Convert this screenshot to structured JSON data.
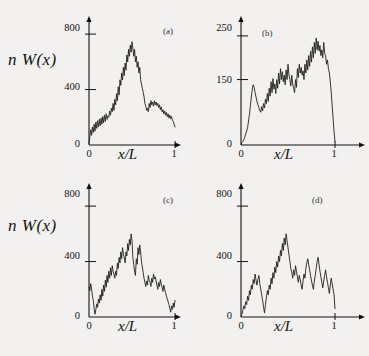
{
  "figure": {
    "background": "#f2f1ef",
    "ink": "#111111",
    "curve_color": "#1f1f1f"
  },
  "chart_data": [
    {
      "type": "line",
      "title": "",
      "panel_label": "(a)",
      "xlabel": "x/L",
      "ylabel": "n W(x)",
      "xlim": [
        0,
        1.05
      ],
      "ylim": [
        0,
        880
      ],
      "xticks": [
        0,
        1
      ],
      "xtick_labels": [
        "0",
        "1"
      ],
      "yticks": [
        0,
        400,
        800
      ],
      "ytick_labels": [
        "0",
        "400",
        "800"
      ],
      "grid": false,
      "legend": "none",
      "x": [
        0.0,
        0.01,
        0.02,
        0.03,
        0.04,
        0.05,
        0.06,
        0.07,
        0.08,
        0.09,
        0.1,
        0.11,
        0.12,
        0.13,
        0.14,
        0.15,
        0.16,
        0.17,
        0.18,
        0.19,
        0.2,
        0.21,
        0.22,
        0.23,
        0.24,
        0.25,
        0.26,
        0.27,
        0.28,
        0.29,
        0.3,
        0.31,
        0.32,
        0.33,
        0.34,
        0.35,
        0.36,
        0.37,
        0.38,
        0.39,
        0.4,
        0.41,
        0.42,
        0.43,
        0.44,
        0.45,
        0.46,
        0.47,
        0.48,
        0.49,
        0.5,
        0.51,
        0.52,
        0.53,
        0.54,
        0.55,
        0.56,
        0.57,
        0.58,
        0.59,
        0.6,
        0.61,
        0.62,
        0.63,
        0.64,
        0.65,
        0.66,
        0.67,
        0.68,
        0.69,
        0.7,
        0.71,
        0.72,
        0.73,
        0.74,
        0.75,
        0.76,
        0.77,
        0.78,
        0.79,
        0.8,
        0.81,
        0.82,
        0.83,
        0.84,
        0.85,
        0.86,
        0.87,
        0.88,
        0.89,
        0.9,
        0.91,
        0.92,
        0.93,
        0.94,
        0.95,
        0.96,
        0.97,
        0.98,
        0.99,
        1.0
      ],
      "values": [
        10,
        60,
        110,
        70,
        130,
        90,
        150,
        100,
        165,
        120,
        175,
        130,
        185,
        140,
        195,
        150,
        205,
        160,
        215,
        170,
        225,
        185,
        210,
        200,
        245,
        215,
        265,
        240,
        300,
        250,
        330,
        290,
        370,
        320,
        420,
        360,
        470,
        430,
        520,
        470,
        560,
        500,
        590,
        540,
        650,
        600,
        690,
        640,
        720,
        670,
        745,
        700,
        640,
        690,
        600,
        640,
        560,
        600,
        520,
        560,
        470,
        440,
        410,
        380,
        350,
        300,
        280,
        250,
        265,
        240,
        300,
        270,
        320,
        290,
        310,
        280,
        320,
        290,
        310,
        285,
        300,
        270,
        290,
        255,
        275,
        240,
        255,
        225,
        245,
        215,
        235,
        205,
        225,
        195,
        215,
        190,
        205,
        180,
        170,
        150,
        130
      ]
    },
    {
      "type": "line",
      "title": "",
      "panel_label": "(b)",
      "xlabel": "x/L",
      "ylabel": "",
      "xlim": [
        0,
        1.05
      ],
      "ylim": [
        0,
        275
      ],
      "xticks": [
        0,
        1
      ],
      "xtick_labels": [
        "0",
        "1"
      ],
      "yticks": [
        0,
        150,
        250
      ],
      "ytick_labels": [
        "0",
        "150",
        "250"
      ],
      "grid": false,
      "legend": "none",
      "x": [
        0.0,
        0.01,
        0.02,
        0.03,
        0.04,
        0.05,
        0.06,
        0.07,
        0.08,
        0.09,
        0.1,
        0.11,
        0.12,
        0.13,
        0.14,
        0.15,
        0.16,
        0.17,
        0.18,
        0.19,
        0.2,
        0.21,
        0.22,
        0.23,
        0.24,
        0.25,
        0.26,
        0.27,
        0.28,
        0.29,
        0.3,
        0.31,
        0.32,
        0.33,
        0.34,
        0.35,
        0.36,
        0.37,
        0.38,
        0.39,
        0.4,
        0.41,
        0.42,
        0.43,
        0.44,
        0.45,
        0.46,
        0.47,
        0.48,
        0.49,
        0.5,
        0.51,
        0.52,
        0.53,
        0.54,
        0.55,
        0.56,
        0.57,
        0.58,
        0.59,
        0.6,
        0.61,
        0.62,
        0.63,
        0.64,
        0.65,
        0.66,
        0.67,
        0.68,
        0.69,
        0.7,
        0.71,
        0.72,
        0.73,
        0.74,
        0.75,
        0.76,
        0.77,
        0.78,
        0.79,
        0.8,
        0.81,
        0.82,
        0.83,
        0.84,
        0.85,
        0.86,
        0.87,
        0.88,
        0.89,
        0.9,
        0.91,
        0.92,
        0.93,
        0.94,
        0.95,
        0.96,
        0.97,
        0.98,
        0.99,
        1.0
      ],
      "values": [
        2,
        5,
        8,
        12,
        18,
        25,
        32,
        40,
        55,
        70,
        90,
        110,
        128,
        138,
        132,
        120,
        110,
        100,
        92,
        86,
        80,
        75,
        88,
        78,
        95,
        85,
        105,
        95,
        118,
        100,
        130,
        112,
        145,
        120,
        152,
        128,
        140,
        118,
        150,
        130,
        165,
        140,
        175,
        150,
        168,
        145,
        160,
        138,
        172,
        150,
        185,
        160,
        150,
        135,
        160,
        140,
        130,
        120,
        150,
        132,
        175,
        155,
        185,
        165,
        178,
        160,
        170,
        150,
        185,
        165,
        195,
        172,
        205,
        180,
        215,
        190,
        225,
        200,
        235,
        210,
        245,
        218,
        238,
        215,
        228,
        205,
        218,
        200,
        235,
        210,
        205,
        185,
        195,
        175,
        165,
        145,
        120,
        90,
        60,
        30,
        8
      ]
    },
    {
      "type": "line",
      "title": "",
      "panel_label": "(c)",
      "xlabel": "x/L",
      "ylabel": "n W(x)",
      "xlim": [
        0,
        1.05
      ],
      "ylim": [
        0,
        880
      ],
      "xticks": [
        0,
        1
      ],
      "xtick_labels": [
        "0",
        "1"
      ],
      "yticks": [
        0,
        400,
        800
      ],
      "ytick_labels": [
        "0",
        "400",
        "800"
      ],
      "grid": false,
      "legend": "none",
      "x": [
        0.0,
        0.01,
        0.02,
        0.03,
        0.04,
        0.05,
        0.06,
        0.07,
        0.08,
        0.09,
        0.1,
        0.11,
        0.12,
        0.13,
        0.14,
        0.15,
        0.16,
        0.17,
        0.18,
        0.19,
        0.2,
        0.21,
        0.22,
        0.23,
        0.24,
        0.25,
        0.26,
        0.27,
        0.28,
        0.29,
        0.3,
        0.31,
        0.32,
        0.33,
        0.34,
        0.35,
        0.36,
        0.37,
        0.38,
        0.39,
        0.4,
        0.41,
        0.42,
        0.43,
        0.44,
        0.45,
        0.46,
        0.47,
        0.48,
        0.49,
        0.5,
        0.51,
        0.52,
        0.53,
        0.54,
        0.55,
        0.56,
        0.57,
        0.58,
        0.59,
        0.6,
        0.61,
        0.62,
        0.63,
        0.64,
        0.65,
        0.66,
        0.67,
        0.68,
        0.69,
        0.7,
        0.71,
        0.72,
        0.73,
        0.74,
        0.75,
        0.76,
        0.77,
        0.78,
        0.79,
        0.8,
        0.81,
        0.82,
        0.83,
        0.84,
        0.85,
        0.86,
        0.87,
        0.88,
        0.89,
        0.9,
        0.91,
        0.92,
        0.93,
        0.94,
        0.95,
        0.96,
        0.97,
        0.98,
        0.99,
        1.0
      ],
      "values": [
        215,
        190,
        240,
        200,
        150,
        120,
        60,
        20,
        55,
        95,
        70,
        130,
        100,
        160,
        120,
        200,
        150,
        230,
        185,
        265,
        215,
        300,
        250,
        330,
        280,
        355,
        300,
        370,
        330,
        310,
        280,
        330,
        300,
        390,
        350,
        430,
        390,
        470,
        420,
        500,
        455,
        430,
        390,
        470,
        440,
        530,
        480,
        560,
        520,
        600,
        550,
        430,
        380,
        330,
        300,
        420,
        380,
        500,
        450,
        520,
        470,
        400,
        360,
        320,
        280,
        250,
        220,
        260,
        230,
        300,
        265,
        250,
        220,
        280,
        250,
        310,
        275,
        290,
        260,
        230,
        200,
        250,
        220,
        270,
        240,
        215,
        185,
        230,
        200,
        175,
        150,
        130,
        110,
        90,
        60,
        35,
        80,
        55,
        100,
        70,
        120
      ]
    },
    {
      "type": "line",
      "title": "",
      "panel_label": "(d)",
      "xlabel": "x/L",
      "ylabel": "",
      "xlim": [
        0,
        1.05
      ],
      "ylim": [
        0,
        880
      ],
      "xticks": [
        0,
        1
      ],
      "xtick_labels": [
        "0",
        "1"
      ],
      "yticks": [
        0,
        400,
        800
      ],
      "ytick_labels": [
        "0",
        "400",
        "800"
      ],
      "grid": false,
      "legend": "none",
      "x": [
        0.0,
        0.01,
        0.02,
        0.03,
        0.04,
        0.05,
        0.06,
        0.07,
        0.08,
        0.09,
        0.1,
        0.11,
        0.12,
        0.13,
        0.14,
        0.15,
        0.16,
        0.17,
        0.18,
        0.19,
        0.2,
        0.21,
        0.22,
        0.23,
        0.24,
        0.25,
        0.26,
        0.27,
        0.28,
        0.29,
        0.3,
        0.31,
        0.32,
        0.33,
        0.34,
        0.35,
        0.36,
        0.37,
        0.38,
        0.39,
        0.4,
        0.41,
        0.42,
        0.43,
        0.44,
        0.45,
        0.46,
        0.47,
        0.48,
        0.49,
        0.5,
        0.51,
        0.52,
        0.53,
        0.54,
        0.55,
        0.56,
        0.57,
        0.58,
        0.59,
        0.6,
        0.61,
        0.62,
        0.63,
        0.64,
        0.65,
        0.66,
        0.67,
        0.68,
        0.69,
        0.7,
        0.71,
        0.72,
        0.73,
        0.74,
        0.75,
        0.76,
        0.77,
        0.78,
        0.79,
        0.8,
        0.81,
        0.82,
        0.83,
        0.84,
        0.85,
        0.86,
        0.87,
        0.88,
        0.89,
        0.9,
        0.91,
        0.92,
        0.93,
        0.94,
        0.95,
        0.96,
        0.97,
        0.98,
        0.99,
        1.0
      ],
      "values": [
        5,
        20,
        50,
        80,
        60,
        110,
        90,
        150,
        120,
        190,
        160,
        230,
        200,
        270,
        240,
        310,
        265,
        230,
        270,
        300,
        240,
        200,
        160,
        120,
        70,
        30,
        90,
        140,
        190,
        160,
        230,
        200,
        280,
        240,
        320,
        280,
        360,
        320,
        400,
        360,
        440,
        400,
        480,
        440,
        530,
        480,
        570,
        520,
        600,
        550,
        500,
        450,
        400,
        350,
        320,
        280,
        340,
        300,
        370,
        330,
        290,
        250,
        300,
        270,
        230,
        200,
        260,
        310,
        280,
        350,
        390,
        420,
        380,
        340,
        300,
        260,
        230,
        200,
        260,
        300,
        350,
        400,
        430,
        380,
        330,
        290,
        250,
        210,
        260,
        300,
        340,
        290,
        250,
        210,
        170,
        230,
        280,
        240,
        200,
        160,
        60
      ]
    }
  ],
  "panels": [
    {
      "tag": "(a)",
      "ylabel": "n W(x)",
      "xlabel": "x/L",
      "y_max_label": "800",
      "y_mid_label": "400",
      "y_zero_label": "0",
      "x_zero_label": "0",
      "x_one_label": "1"
    },
    {
      "tag": "(b)",
      "ylabel": "",
      "xlabel": "x/L",
      "y_max_label": "250",
      "y_mid_label": "150",
      "y_zero_label": "0",
      "x_zero_label": "0",
      "x_one_label": "1"
    },
    {
      "tag": "(c)",
      "ylabel": "n W(x)",
      "xlabel": "x/L",
      "y_max_label": "800",
      "y_mid_label": "400",
      "y_zero_label": "0",
      "x_zero_label": "0",
      "x_one_label": "1"
    },
    {
      "tag": "(d)",
      "ylabel": "",
      "xlabel": "x/L",
      "y_max_label": "800",
      "y_mid_label": "400",
      "y_zero_label": "0",
      "x_zero_label": "0",
      "x_one_label": "1"
    }
  ]
}
